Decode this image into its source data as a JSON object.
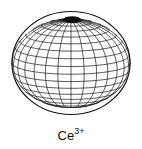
{
  "figure": {
    "shape": "oblate spheroid wireframe",
    "label_base": "Ce",
    "label_charge": "3+",
    "colors": {
      "line": "#111111",
      "background": "#ffffff"
    },
    "geometry": {
      "cx": 71,
      "cy": 63,
      "rx": 59,
      "ry": 52,
      "tilt_deg": 12,
      "meridians": 28,
      "parallels": 18
    }
  }
}
